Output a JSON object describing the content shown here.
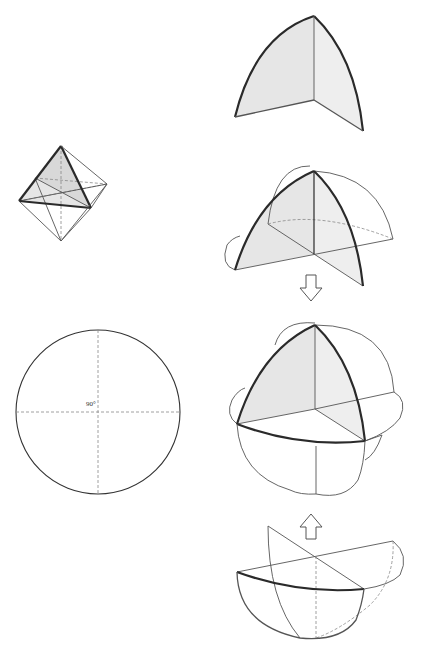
{
  "figures": {
    "octahedron": {
      "label": "octahedron with shaded face"
    },
    "circle": {
      "angle_label": "90°"
    },
    "spherical_triangle": {
      "label": "single spherical triangle"
    },
    "partial_sphere": {
      "label": "spherical triangle with great circle arcs"
    },
    "assembled_sphere": {
      "label": "assembled spherical octant model"
    },
    "lower_half": {
      "label": "lower hemisphere segment"
    }
  },
  "arrows": [
    {
      "direction": "down"
    },
    {
      "direction": "up"
    }
  ],
  "colors": {
    "line": "#2a2a2a",
    "shade": "#e6e6e6",
    "background": "#ffffff"
  }
}
